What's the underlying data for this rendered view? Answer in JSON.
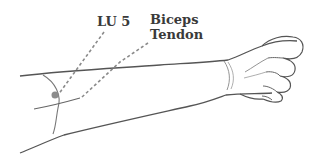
{
  "diagram": {
    "labels": {
      "point": "LU 5",
      "tendon_line1": "Biceps",
      "tendon_line2": "Tendon"
    },
    "colors": {
      "outline": "#555555",
      "leader_line": "#8a8a8a",
      "point_marker": "#8c8c8c",
      "text": "#3a3a3a",
      "background": "#ffffff"
    }
  }
}
